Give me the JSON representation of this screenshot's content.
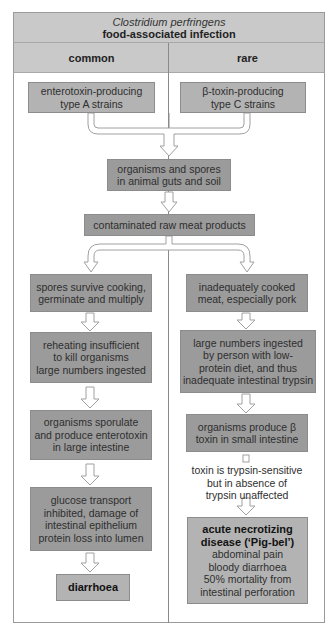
{
  "header": {
    "title_italic": "Clostridium perfringens",
    "title_bold": "food-associated infection"
  },
  "columns": {
    "left_label": "common",
    "right_label": "rare"
  },
  "top": {
    "left_strain": [
      "enterotoxin-producing",
      "type A strains"
    ],
    "right_strain": [
      "β-toxin-producing",
      "type C strains"
    ],
    "reservoir": [
      "organisms and spores",
      "in animal guts and soil"
    ],
    "vehicle": [
      "contaminated raw meat products"
    ]
  },
  "left_path": {
    "step1": [
      "spores survive cooking,",
      "germinate and multiply"
    ],
    "step2": [
      "reheating insufficient",
      "to kill organisms",
      "large numbers ingested"
    ],
    "step3": [
      "organisms sporulate",
      "and produce enterotoxin",
      "in large intestine"
    ],
    "step4": [
      "glucose transport",
      "inhibited, damage of",
      "intestinal epithelium",
      "protein loss into lumen"
    ],
    "outcome": "diarrhoea"
  },
  "right_path": {
    "step1": [
      "inadequately cooked",
      "meat, especially pork"
    ],
    "step2": [
      "large numbers ingested",
      "by person with low-",
      "protein diet, and thus",
      "inadequate intestinal trypsin"
    ],
    "step3": [
      "organisms produce β",
      "toxin in small intestine"
    ],
    "note": [
      "toxin is trypsin-sensitive",
      "but in absence of",
      "trypsin unaffected"
    ],
    "outcome_title": [
      "acute necrotizing",
      "disease (‘Pig-bel’)"
    ],
    "outcome_details": [
      "abdominal pain",
      "bloody diarrhoea",
      "50% mortality from",
      "intestinal perforation"
    ]
  },
  "colors": {
    "band": "#c9c9c9",
    "box_dark": "#9b9b9b",
    "box_light": "#b3b3b3",
    "frame": "#9a9a9a"
  }
}
